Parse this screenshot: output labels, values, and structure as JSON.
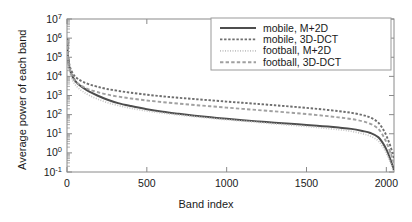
{
  "chart_data": {
    "type": "line",
    "title": "",
    "xlabel": "Band index",
    "ylabel": "Average power of each band",
    "xlim": [
      0,
      2048
    ],
    "ylim": [
      0.1,
      10000000
    ],
    "yscale": "log",
    "xticks": [
      0,
      500,
      1000,
      1500,
      2000
    ],
    "xticklabels": [
      "0",
      "500",
      "1000",
      "1500",
      "2000"
    ],
    "yticks": [
      0.1,
      1,
      10,
      100,
      1000,
      10000,
      100000,
      1000000,
      10000000
    ],
    "yticklabels": [
      "10-1",
      "100",
      "101",
      "102",
      "103",
      "104",
      "105",
      "106",
      "107"
    ],
    "grid": false,
    "legend_position": "upper right",
    "series": [
      {
        "name": "mobile, M+2D",
        "color": "#4d4d4d",
        "style": "solid",
        "x": [
          1,
          5,
          12,
          22,
          35,
          50,
          70,
          100,
          140,
          190,
          250,
          320,
          400,
          500,
          600,
          700,
          800,
          900,
          1000,
          1100,
          1200,
          1300,
          1400,
          1500,
          1600,
          1700,
          1780,
          1850,
          1900,
          1950,
          1990,
          2020,
          2040,
          2048
        ],
        "y": [
          900000,
          120000,
          40000,
          18000,
          9500,
          6000,
          4000,
          2600,
          1600,
          1000,
          620,
          400,
          280,
          190,
          140,
          110,
          88,
          72,
          60,
          51,
          44,
          38,
          33,
          29,
          25,
          21,
          18,
          14,
          11,
          6.5,
          2.2,
          0.6,
          0.2,
          0.12
        ]
      },
      {
        "name": "mobile, 3D-DCT",
        "color": "#6e6e6e",
        "style": "dotted-coarse",
        "x": [
          1,
          5,
          12,
          22,
          35,
          50,
          70,
          100,
          140,
          190,
          250,
          320,
          400,
          500,
          600,
          700,
          800,
          900,
          1000,
          1100,
          1200,
          1300,
          1400,
          1500,
          1600,
          1700,
          1780,
          1850,
          1900,
          1950,
          1990,
          2020,
          2040,
          2048
        ],
        "y": [
          950000,
          150000,
          55000,
          26000,
          15000,
          10000,
          7200,
          5200,
          3800,
          2900,
          2200,
          1750,
          1400,
          1100,
          900,
          760,
          650,
          560,
          480,
          415,
          360,
          310,
          265,
          225,
          188,
          152,
          125,
          95,
          70,
          38,
          12,
          3.0,
          0.9,
          0.5
        ]
      },
      {
        "name": "football, M+2D",
        "color": "#c4c4c4",
        "style": "dotted-fine",
        "x": [
          1,
          5,
          12,
          22,
          35,
          50,
          70,
          100,
          140,
          190,
          250,
          320,
          400,
          500,
          600,
          700,
          800,
          900,
          1000,
          1100,
          1200,
          1300,
          1400,
          1500,
          1600,
          1700,
          1780,
          1850,
          1900,
          1950,
          1990,
          2020,
          2040,
          2048
        ],
        "y": [
          700000,
          90000,
          28000,
          12000,
          6200,
          3900,
          2500,
          1600,
          1000,
          660,
          430,
          300,
          215,
          155,
          120,
          96,
          78,
          64,
          54,
          46,
          39,
          33,
          28,
          24,
          20,
          16.5,
          13.5,
          10,
          7.5,
          4.2,
          1.4,
          0.4,
          0.15,
          0.1
        ]
      },
      {
        "name": "football, 3D-DCT",
        "color": "#a0a0a0",
        "style": "dashed",
        "x": [
          1,
          5,
          12,
          22,
          35,
          50,
          70,
          100,
          140,
          190,
          250,
          320,
          400,
          500,
          600,
          700,
          800,
          900,
          1000,
          1100,
          1200,
          1300,
          1400,
          1500,
          1600,
          1700,
          1780,
          1850,
          1900,
          1950,
          1990,
          2020,
          2040,
          2048
        ],
        "y": [
          800000,
          110000,
          38000,
          17000,
          9000,
          5800,
          4100,
          2900,
          2050,
          1520,
          1130,
          880,
          700,
          550,
          450,
          375,
          318,
          272,
          233,
          200,
          172,
          148,
          126,
          107,
          89,
          72,
          59,
          45,
          33,
          18,
          5.5,
          1.4,
          0.45,
          0.25
        ]
      }
    ]
  },
  "legend": {
    "entries": [
      {
        "label": "mobile, M+2D"
      },
      {
        "label": "mobile, 3D-DCT"
      },
      {
        "label": "football, M+2D"
      },
      {
        "label": "football, 3D-DCT"
      }
    ]
  },
  "axes": {
    "x_title": "Band index",
    "y_title": "Average power of each band"
  }
}
